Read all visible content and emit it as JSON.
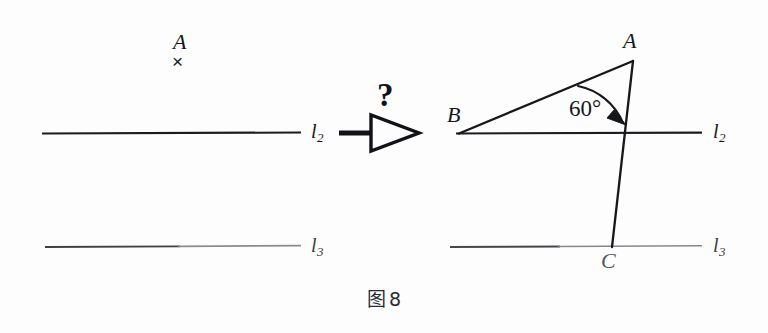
{
  "figure": {
    "caption_glyph": "图",
    "caption_number": "8",
    "background_color": "#fdfdfd",
    "ink_color": "#16171b"
  },
  "left_panel": {
    "point_a_label": "A",
    "point_a_mark": "×",
    "line_l2_label": "l",
    "line_l2_sub": "2",
    "line_l3_label": "l",
    "line_l3_sub": "3"
  },
  "middle": {
    "question_mark": "?",
    "arrow_icon": "hollow-triangle-right"
  },
  "right_panel": {
    "vertex_a_label": "A",
    "vertex_b_label": "B",
    "vertex_c_label": "C",
    "angle_label": "60°",
    "angle_value": 60,
    "line_l2_label": "l",
    "line_l2_sub": "2",
    "line_l3_label": "l",
    "line_l3_sub": "3"
  }
}
